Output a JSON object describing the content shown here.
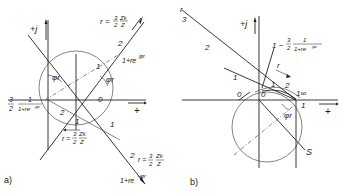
{
  "figure_a": {
    "caption": "a)",
    "axis_j": "+j",
    "axis_real": "+",
    "label_r_top": "r = 3/2 · Zk/Z",
    "label_r_top_parts": {
      "r": "r =",
      "num1": "3",
      "den1": "2",
      "num2": "Zk",
      "den2": "Z"
    },
    "label_phasor_plus": "1+re",
    "label_phasor_plus_exp": "jφr",
    "label_phasor_minus": "1+re",
    "label_phasor_minus_exp": "−jφr",
    "label_r_mid": {
      "r": "r =",
      "num1": "3",
      "den1": "2",
      "num2": "Zk",
      "den2": "Z"
    },
    "label_r_bottom": {
      "r": "r =",
      "num1": "3",
      "den1": "2",
      "num2": "Zk",
      "den2": "Z"
    },
    "label_left_expr": {
      "num1": "3",
      "den1": "2",
      "num2": "1",
      "den2": "1+re",
      "den2_exp": "jφr"
    },
    "angle_label": "φr",
    "ticks": {
      "upper_1": "1",
      "upper_2": "2",
      "zero": "0",
      "lower_1": "1",
      "lower_2": "2",
      "mid_1": "1",
      "mid_2": "2"
    }
  },
  "figure_b": {
    "caption": "b)",
    "axis_j": "+j",
    "axis_real": "+",
    "label_r_top": "r",
    "label_r_arrow": "r",
    "label_expr": {
      "one": "1 −",
      "num1": "3",
      "den1": "2",
      "num2": "1",
      "den2": "1+re",
      "den2_exp": "jφr"
    },
    "angle_label": "φr",
    "point_S": "S",
    "ticks": {
      "line_3": "3",
      "line_2": "2",
      "line_1": "1",
      "zero_left": "0",
      "zero_origin": "0",
      "arc_1": "1",
      "arc_2": "2",
      "arc_inf": "1∞",
      "real_1": "1"
    }
  }
}
